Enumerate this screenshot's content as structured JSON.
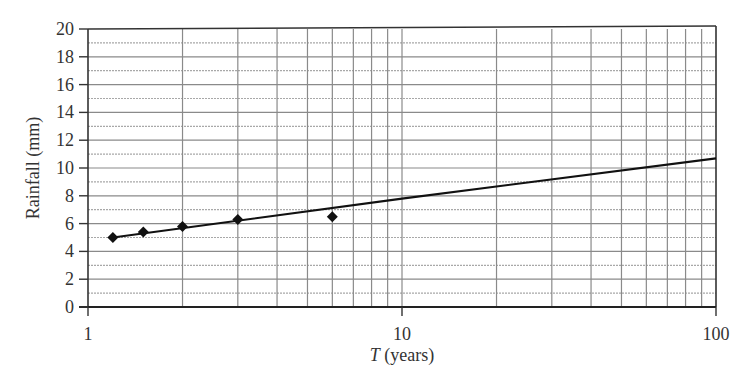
{
  "chart_data": {
    "type": "scatter",
    "title": "",
    "xlabel": "T (years)",
    "xlabel_parts": {
      "var": "T",
      "unit": " (years)"
    },
    "ylabel": "Rainfall (mm)",
    "xscale": "log",
    "xlim": [
      1,
      100
    ],
    "ylim": [
      0,
      20
    ],
    "grid": true,
    "legend": null,
    "x_tick_labels": [
      "1",
      "10",
      "100"
    ],
    "x_ticks": [
      1,
      10,
      100
    ],
    "y_tick_labels": [
      "0",
      "2",
      "4",
      "6",
      "8",
      "10",
      "12",
      "14",
      "16",
      "18",
      "20"
    ],
    "y_ticks": [
      0,
      2,
      4,
      6,
      8,
      10,
      12,
      14,
      16,
      18,
      20
    ],
    "series": [
      {
        "name": "Observed data",
        "type": "scatter",
        "marker": "diamond",
        "color": "#111111",
        "x": [
          1.2,
          1.5,
          2.0,
          3.0,
          6.0
        ],
        "y": [
          5.0,
          5.4,
          5.8,
          6.3,
          6.5
        ]
      },
      {
        "name": "Fitted line",
        "type": "line",
        "color": "#111111",
        "x": [
          1.2,
          10,
          100
        ],
        "y": [
          5.0,
          7.8,
          10.7
        ]
      }
    ]
  }
}
